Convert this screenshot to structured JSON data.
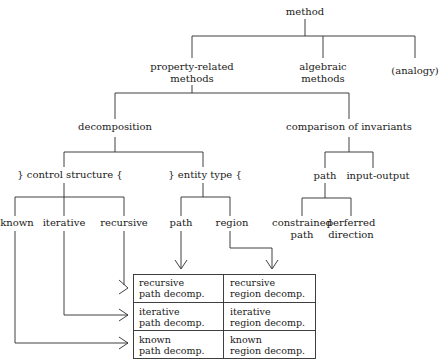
{
  "diagram": {
    "type": "hierarchy-tree-with-matrix",
    "root": {
      "label": "method",
      "children": [
        {
          "label": "property-related methods",
          "lines": [
            "property-related",
            "methods"
          ],
          "children": [
            {
              "label": "decomposition",
              "children": [
                {
                  "label": "} control structure {",
                  "children": [
                    {
                      "label": "known"
                    },
                    {
                      "label": "iterative"
                    },
                    {
                      "label": "recursive"
                    }
                  ]
                },
                {
                  "label": "} entity type {",
                  "children": [
                    {
                      "label": "path"
                    },
                    {
                      "label": "region"
                    }
                  ]
                }
              ]
            },
            {
              "label": "comparison of invariants",
              "children": [
                {
                  "label": "path",
                  "children": [
                    {
                      "label": "constrained path",
                      "lines": [
                        "constrained",
                        "path"
                      ]
                    },
                    {
                      "label": "perferred direction",
                      "lines": [
                        "perferred",
                        "direction"
                      ]
                    }
                  ]
                },
                {
                  "label": "input-output"
                }
              ]
            }
          ]
        },
        {
          "label": "algebraic methods",
          "lines": [
            "algebraic",
            "methods"
          ]
        },
        {
          "label": "(analogy)"
        }
      ]
    },
    "matrix": {
      "columns": [
        "path",
        "region"
      ],
      "rows": [
        "recursive",
        "iterative",
        "known"
      ],
      "cells": [
        [
          [
            "recursive",
            "path decomp."
          ],
          [
            "recursive",
            "region decomp."
          ]
        ],
        [
          [
            "iterative",
            "path decomp."
          ],
          [
            "iterative",
            "region decomp."
          ]
        ],
        [
          [
            "known",
            "path decomp."
          ],
          [
            "known",
            "region decomp."
          ]
        ]
      ]
    },
    "line_color": "#2a2a2a"
  },
  "labels": {
    "method": "method",
    "prop1": "property-related",
    "prop2": "methods",
    "alg1": "algebraic",
    "alg2": "methods",
    "analogy": "(analogy)",
    "decomposition": "decomposition",
    "comparison": "comparison of invariants",
    "control": "} control structure {",
    "entity": "} entity type {",
    "cpath": "path",
    "io": "input-output",
    "known": "known",
    "iterative": "iterative",
    "recursive": "recursive",
    "epath": "path",
    "region": "region",
    "constrained1": "constrained",
    "constrained2": "path",
    "preferred1": "perferred",
    "preferred2": "direction"
  },
  "table": {
    "r0c0a": "recursive",
    "r0c0b": "path decomp.",
    "r0c1a": "recursive",
    "r0c1b": "region decomp.",
    "r1c0a": "iterative",
    "r1c0b": "path decomp.",
    "r1c1a": "iterative",
    "r1c1b": "region decomp.",
    "r2c0a": "known",
    "r2c0b": "path decomp.",
    "r2c1a": "known",
    "r2c1b": "region decomp."
  }
}
